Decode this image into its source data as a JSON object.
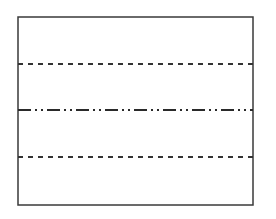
{
  "diagram": {
    "frame": {
      "x": 18,
      "y": 17,
      "width": 235,
      "height": 188,
      "stroke": "#3a3a3a",
      "stroke_width": 1.5
    },
    "lines": [
      {
        "id": "upper-dashed",
        "style": "dashed",
        "y": 64,
        "stroke": "#333333",
        "dasharray": "5,5"
      },
      {
        "id": "center-dash-dot-dot",
        "style": "dash-dot-dot",
        "y": 110,
        "stroke": "#2a2a2a",
        "dasharray": "13,4,2,4,2,4"
      },
      {
        "id": "lower-dashed",
        "style": "dashed",
        "y": 157,
        "stroke": "#333333",
        "dasharray": "5,5"
      }
    ]
  }
}
